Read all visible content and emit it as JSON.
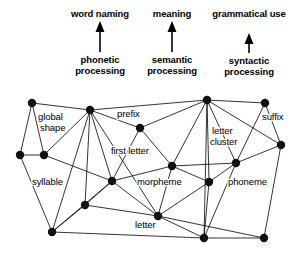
{
  "figure": {
    "background_color": "#ffffff",
    "ink_color": "#000000",
    "node_color": "#111111"
  },
  "pathways": [
    {
      "output_label": "word naming",
      "process_label_line1": "phonetic",
      "process_label_line2": "processing",
      "arrow_icon": "up-arrow-icon"
    },
    {
      "output_label": "meaning",
      "process_label_line1": "semantic",
      "process_label_line2": "processing",
      "arrow_icon": "up-arrow-icon"
    },
    {
      "output_label": "grammatical use",
      "process_label_line1": "syntactic",
      "process_label_line2": "processing",
      "arrow_icon": "up-arrow-icon"
    }
  ],
  "network": {
    "labels": [
      {
        "text": "global",
        "x": 38,
        "y": 120
      },
      {
        "text": "shape",
        "x": 40,
        "y": 131
      },
      {
        "text": "prefix",
        "x": 117,
        "y": 117
      },
      {
        "text": "suffix",
        "x": 262,
        "y": 120
      },
      {
        "text": "first letter",
        "x": 111,
        "y": 154
      },
      {
        "text": "letter",
        "x": 212,
        "y": 134
      },
      {
        "text": "cluster",
        "x": 210,
        "y": 145
      },
      {
        "text": "syllable",
        "x": 32,
        "y": 185
      },
      {
        "text": "morpheme",
        "x": 137,
        "y": 185
      },
      {
        "text": "phoneme",
        "x": 228,
        "y": 185
      },
      {
        "text": "letter",
        "x": 135,
        "y": 228
      }
    ],
    "nodes": [
      {
        "id": "n0",
        "name": "global-shape-upper-node",
        "x": 32,
        "y": 103
      },
      {
        "id": "n1",
        "name": "global-shape-hub-node",
        "x": 90,
        "y": 110
      },
      {
        "id": "n2",
        "name": "prefix-node",
        "x": 140,
        "y": 128
      },
      {
        "id": "n3",
        "name": "top-right-hub-node",
        "x": 207,
        "y": 100
      },
      {
        "id": "n4",
        "name": "suffix-node",
        "x": 265,
        "y": 103
      },
      {
        "id": "n5",
        "name": "left-edge-node",
        "x": 20,
        "y": 155
      },
      {
        "id": "n6",
        "name": "syllable-upper-node",
        "x": 44,
        "y": 155
      },
      {
        "id": "n7",
        "name": "right-edge-node",
        "x": 281,
        "y": 145
      },
      {
        "id": "n8",
        "name": "first-letter-lower-node",
        "x": 172,
        "y": 166
      },
      {
        "id": "n9",
        "name": "letter-cluster-node",
        "x": 236,
        "y": 163
      },
      {
        "id": "n10",
        "name": "morpheme-node",
        "x": 112,
        "y": 181
      },
      {
        "id": "n11",
        "name": "phoneme-upper-node",
        "x": 209,
        "y": 182
      },
      {
        "id": "n12",
        "name": "syllable-mid-node",
        "x": 85,
        "y": 205
      },
      {
        "id": "n13",
        "name": "letter-node",
        "x": 158,
        "y": 216
      },
      {
        "id": "n14",
        "name": "bottom-left-node",
        "x": 52,
        "y": 232
      },
      {
        "id": "n15",
        "name": "bottom-mid-node",
        "x": 204,
        "y": 238
      },
      {
        "id": "n16",
        "name": "bottom-right-node",
        "x": 264,
        "y": 238
      }
    ],
    "edges": [
      [
        "n0",
        "n1"
      ],
      [
        "n0",
        "n5"
      ],
      [
        "n0",
        "n6"
      ],
      [
        "n1",
        "n2"
      ],
      [
        "n1",
        "n3"
      ],
      [
        "n1",
        "n6"
      ],
      [
        "n1",
        "n10"
      ],
      [
        "n1",
        "n12"
      ],
      [
        "n1",
        "n14"
      ],
      [
        "n1",
        "n13"
      ],
      [
        "n2",
        "n3"
      ],
      [
        "n2",
        "n8"
      ],
      [
        "n2",
        "n10"
      ],
      [
        "n3",
        "n4"
      ],
      [
        "n3",
        "n7"
      ],
      [
        "n3",
        "n8"
      ],
      [
        "n3",
        "n9"
      ],
      [
        "n3",
        "n11"
      ],
      [
        "n3",
        "n15"
      ],
      [
        "n4",
        "n7"
      ],
      [
        "n4",
        "n9"
      ],
      [
        "n5",
        "n6"
      ],
      [
        "n5",
        "n14"
      ],
      [
        "n6",
        "n10"
      ],
      [
        "n7",
        "n9"
      ],
      [
        "n7",
        "n16"
      ],
      [
        "n8",
        "n9"
      ],
      [
        "n8",
        "n10"
      ],
      [
        "n8",
        "n13"
      ],
      [
        "n8",
        "n11"
      ],
      [
        "n9",
        "n11"
      ],
      [
        "n9",
        "n15"
      ],
      [
        "n10",
        "n12"
      ],
      [
        "n10",
        "n13"
      ],
      [
        "n10",
        "n14"
      ],
      [
        "n11",
        "n13"
      ],
      [
        "n11",
        "n15"
      ],
      [
        "n12",
        "n13"
      ],
      [
        "n12",
        "n14"
      ],
      [
        "n13",
        "n15"
      ],
      [
        "n13",
        "n16"
      ],
      [
        "n14",
        "n15"
      ],
      [
        "n15",
        "n16"
      ]
    ]
  }
}
